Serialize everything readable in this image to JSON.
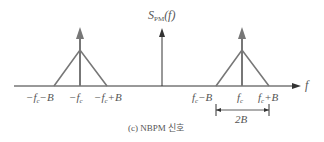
{
  "diagram": {
    "y_axis_label": {
      "main": "S",
      "sub": "PM",
      "arg": "(f)"
    },
    "x_axis_label": "f",
    "caption": "(c) NBPM 신호",
    "colors": {
      "axis": "#333333",
      "spectrum": "#777777",
      "text": "#555555"
    },
    "left_component": {
      "labels": {
        "lower": "−f_c−B",
        "center": "−f_c",
        "upper": "−f_c+B"
      }
    },
    "right_component": {
      "labels": {
        "lower": "f_c−B",
        "center": "f_c",
        "upper": "f_c+B"
      }
    },
    "bandwidth_label": "2B"
  }
}
